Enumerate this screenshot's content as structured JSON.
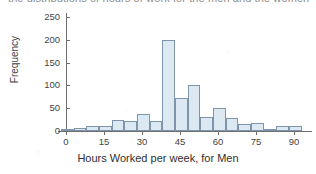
{
  "caption": {
    "text": "the distributions of hours of work for the men and the women"
  },
  "chart_data": {
    "type": "bar",
    "title": "",
    "xlabel": "Hours Worked per week, for Men",
    "ylabel": "Frequency",
    "bin_width": 5,
    "xlim": [
      -2,
      95
    ],
    "ylim": [
      0,
      262
    ],
    "grid": false,
    "legend": null,
    "bar_fill": "#dce9f3",
    "bar_edge": "#7f95ab",
    "axis_color": "#6e6e6e",
    "xticks": [
      0,
      15,
      30,
      45,
      60,
      75,
      90
    ],
    "yticks": [
      0,
      50,
      100,
      150,
      200,
      250
    ],
    "bins": [
      {
        "start": -2,
        "end": 3,
        "value": 3
      },
      {
        "start": 3,
        "end": 8,
        "value": 7
      },
      {
        "start": 8,
        "end": 13,
        "value": 10
      },
      {
        "start": 13,
        "end": 18,
        "value": 11
      },
      {
        "start": 18,
        "end": 23,
        "value": 24
      },
      {
        "start": 23,
        "end": 28,
        "value": 22
      },
      {
        "start": 28,
        "end": 33,
        "value": 37
      },
      {
        "start": 33,
        "end": 38,
        "value": 23
      },
      {
        "start": 38,
        "end": 43,
        "value": 200
      },
      {
        "start": 43,
        "end": 48,
        "value": 72
      },
      {
        "start": 48,
        "end": 53,
        "value": 100
      },
      {
        "start": 53,
        "end": 58,
        "value": 30
      },
      {
        "start": 58,
        "end": 63,
        "value": 51
      },
      {
        "start": 63,
        "end": 68,
        "value": 28
      },
      {
        "start": 68,
        "end": 73,
        "value": 16
      },
      {
        "start": 73,
        "end": 78,
        "value": 18
      },
      {
        "start": 78,
        "end": 83,
        "value": 5
      },
      {
        "start": 83,
        "end": 88,
        "value": 11
      },
      {
        "start": 88,
        "end": 93,
        "value": 12
      }
    ]
  }
}
